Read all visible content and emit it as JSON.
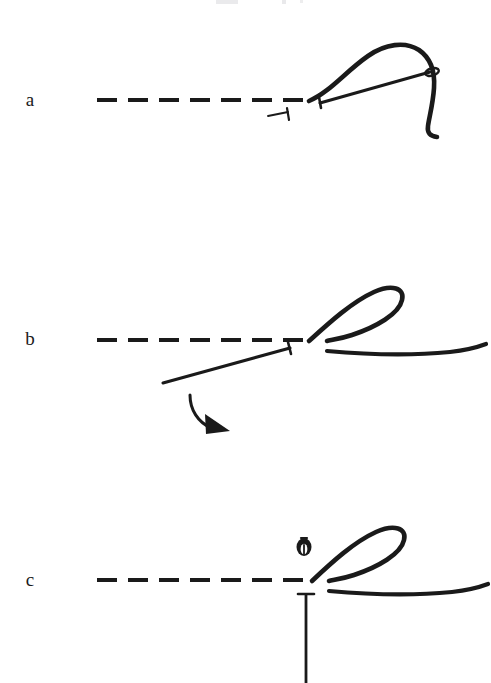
{
  "figure": {
    "background_color": "#ffffff",
    "ink_color": "#1a1a1a",
    "width": 491,
    "height": 683,
    "cropped_header_remnant": "",
    "panels": [
      {
        "id": "a",
        "label": "a",
        "label_x": 30,
        "label_y": 106,
        "caption": "Needle lying flat along the tissue plane, thread arc raised above the needle shaft",
        "dashed_line": {
          "name": "tissue-plane-dashed-line",
          "x1": 97,
          "x2": 307,
          "y": 100,
          "dash_length": 20,
          "gap_length": 11,
          "thickness": 4
        },
        "elements": [
          "thread-arc",
          "needle-shaft",
          "needle-eye",
          "needle-tip-crossbar",
          "small-needle-tip-marker"
        ]
      },
      {
        "id": "b",
        "label": "b",
        "label_x": 30,
        "label_y": 345,
        "caption": "Needle swung downward to the left; thread drawn into a teardrop loop; curved arrow shows rotation direction",
        "dashed_line": {
          "name": "tissue-plane-dashed-line",
          "x1": 97,
          "x2": 307,
          "y": 340,
          "dash_length": 20,
          "gap_length": 11,
          "thickness": 4
        },
        "elements": [
          "thread-loop",
          "thread-tail",
          "needle-shaft",
          "needle-tip-crossbar",
          "rotation-arrow"
        ]
      },
      {
        "id": "c",
        "label": "c",
        "label_x": 30,
        "label_y": 586,
        "caption": "Needle rotated fully vertical and driven downward through the tissue plane; needle eye seen end-on above the line",
        "dashed_line": {
          "name": "tissue-plane-dashed-line",
          "x1": 97,
          "x2": 307,
          "y": 580,
          "dash_length": 20,
          "gap_length": 11,
          "thickness": 4
        },
        "elements": [
          "thread-loop",
          "thread-tail",
          "needle-eye-end-on",
          "vertical-needle-shaft",
          "needle-tip-crossbar"
        ]
      }
    ]
  }
}
